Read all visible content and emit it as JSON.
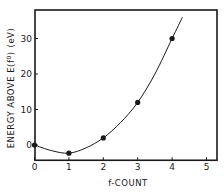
{
  "chart_data": {
    "type": "line",
    "title": "",
    "xlabel": "f-COUNT",
    "ylabel": "ENERGY   ABOVE   E(f⁰)   (eV)",
    "ylabel_parts": {
      "main": "ENERGY   ABOVE   E(f",
      "sup": "0",
      "close": ")",
      "unit": "(eV)"
    },
    "xlim": [
      0,
      5.3
    ],
    "ylim": [
      -4.3,
      37.5
    ],
    "x_ticks": [
      0,
      1,
      2,
      3,
      4,
      5
    ],
    "y_ticks": [
      0,
      10,
      20,
      30
    ],
    "grid": false,
    "legend": null,
    "series": [
      {
        "name": "energy",
        "markers": "filled-circle",
        "line": "smooth-fit",
        "x": [
          0,
          1,
          2,
          3,
          4
        ],
        "y": [
          0,
          -2.3,
          2,
          12,
          30
        ]
      }
    ],
    "fit_curve": {
      "x": [
        0,
        0.5,
        1,
        1.5,
        2,
        2.5,
        3,
        3.5,
        4,
        4.3
      ],
      "y": [
        0,
        -1.6,
        -2.3,
        -0.8,
        2,
        6.3,
        12,
        20,
        30,
        36
      ]
    }
  },
  "colors": {
    "ink": "#1a1a1a",
    "background": "#ffffff"
  }
}
